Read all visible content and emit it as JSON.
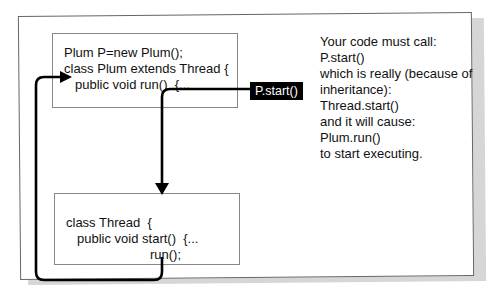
{
  "diagram": {
    "plum_box": {
      "lines": [
        "Plum P=new Plum();",
        "class Plum extends Thread {",
        "public void run()  {..."
      ]
    },
    "thread_box": {
      "lines": [
        "class Thread  {",
        "public void start()  {...",
        "run();"
      ]
    },
    "callout_label": "P.start()",
    "explanation": [
      "Your code must call:",
      "P.start()",
      "which is really (because of",
      "inheritance):",
      "Thread.start()",
      "and it will cause:",
      "Plum.run()",
      "to start executing."
    ],
    "arrows": [
      {
        "from": "P.start()",
        "to": "class Thread start()",
        "icon": "arrow-down-icon"
      },
      {
        "from": "run() call in Thread",
        "to": "Plum.run()",
        "icon": "arrow-right-icon"
      }
    ],
    "colors": {
      "panel_border": "#666666",
      "box_border": "#888888",
      "shadow": "#d6d6d6",
      "callout_bg": "#000000",
      "callout_text": "#ffffff"
    }
  }
}
